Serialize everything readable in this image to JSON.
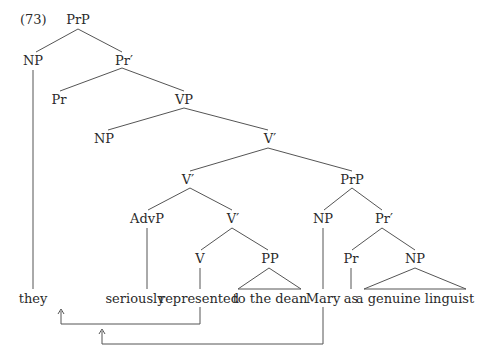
{
  "example_number": "(73)",
  "nodes": {
    "prp_root": "PrP",
    "np_subject": "NP",
    "pr_bar_top": "Pr′",
    "pr_top": "Pr",
    "vp": "VP",
    "np_spec_vp": "NP",
    "v_bar_top": "V′",
    "v_bar_mid": "V′",
    "prp_small": "PrP",
    "advp": "AdvP",
    "v_bar_low": "V′",
    "np_mary": "NP",
    "pr_bar_small": "Pr′",
    "v": "V",
    "pp": "PP",
    "pr_small": "Pr",
    "np_pred": "NP"
  },
  "words": {
    "they": "they",
    "seriously": "seriously",
    "represented": "represented",
    "to_the_dean": "to the dean",
    "mary": "Mary",
    "as": "as",
    "a_genuine_linguist": "a genuine linguist"
  },
  "movement_arrows": [
    {
      "from": "represented",
      "to": "Pr (head of higher PrP)",
      "glyph": "↑"
    },
    {
      "from": "Mary",
      "to": "NP (specifier of VP)",
      "glyph": "↑"
    }
  ],
  "colors": {
    "text": "#2a2a2a",
    "lines": "#555555",
    "background": "#ffffff"
  }
}
